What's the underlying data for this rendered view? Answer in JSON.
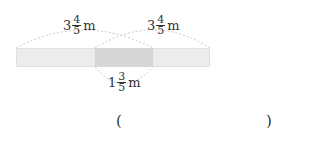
{
  "labels": {
    "left_length": {
      "whole": "3",
      "numerator": "4",
      "denominator": "5",
      "unit": "m"
    },
    "right_length": {
      "whole": "3",
      "numerator": "4",
      "denominator": "5",
      "unit": "m"
    },
    "overlap_length": {
      "whole": "1",
      "numerator": "3",
      "denominator": "5",
      "unit": "m"
    }
  },
  "answer": {
    "open_paren": "(",
    "close_paren": ")",
    "value": ""
  },
  "colors": {
    "bar": "#ececec",
    "overlap": "#d6d6d6",
    "arc": "#c8c8c8"
  }
}
